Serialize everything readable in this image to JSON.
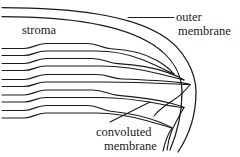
{
  "figure": {
    "type": "biological-line-diagram",
    "background_color": "#ffffff",
    "line_color": "#1a1a1a",
    "text_color": "#1a1a1a"
  },
  "labels": {
    "stroma": "stroma",
    "outer_membrane_line1": "outer",
    "outer_membrane_line2": "membrane",
    "convoluted_membrane_line1": "convoluted",
    "convoluted_membrane_line2": "membrane"
  },
  "structures": {
    "outer_membrane": "large arc on right side enclosing the organelle",
    "stroma": "open region in the upper left between outer membrane and lamellae",
    "lamellae": "stack of five flattened membrane sacs running left to right, tapering to points at the right",
    "convoluted_membrane": "folded membrane region at lower right where lamellae converge"
  },
  "leader_lines": {
    "outer_membrane": "horizontal line from label leftward to the outer membrane curve",
    "convoluted_membrane": "diagonal line from label upward-right to the convoluted membrane region"
  }
}
